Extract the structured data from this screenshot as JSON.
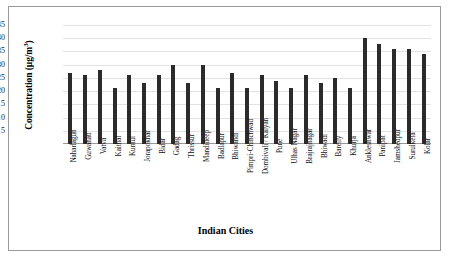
{
  "chart_data": {
    "type": "bar",
    "title": "",
    "xlabel": "Indian Cities",
    "ylabel": "Concentration (µg/m³)",
    "ylabel_main": "Concentration (µg/m",
    "ylabel_exp": "3",
    "ylabel_tail": ")",
    "ylim": [
      0,
      45
    ],
    "yticks": [
      45,
      40,
      35,
      30,
      25,
      20,
      15,
      10,
      5,
      0
    ],
    "grid": true,
    "legend": false,
    "bar_color": "#2b2b2b",
    "categories": [
      "Naharlagun",
      "Guwahati",
      "Vatva",
      "Kaithal",
      "Kurnul",
      "Jorapokhar",
      "Bidar",
      "Gadag",
      "Thrissur",
      "Mandideep",
      "Badlapur",
      "Bhiwandi",
      "Pimpri-Chinchwad",
      "Dombivali / Kalyan",
      "Pune",
      "Ulhas Nagar",
      "Brajrajnagar",
      "Bhiwadi",
      "Bareily",
      "Khurja",
      "Ankleshwar",
      "Panipat",
      "Jamshedpur",
      "Surulkela",
      "Kolar"
    ],
    "values": [
      27,
      26,
      28,
      21,
      26,
      23,
      26,
      30,
      23,
      30,
      21,
      27,
      21,
      26,
      24,
      21,
      26,
      23,
      25,
      21,
      40,
      38,
      36,
      36,
      34
    ]
  }
}
